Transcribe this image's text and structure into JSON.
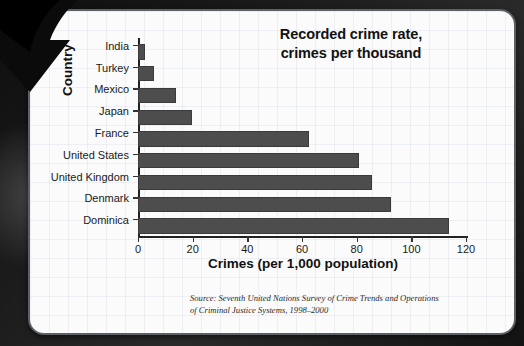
{
  "chart_data": {
    "type": "bar",
    "orientation": "horizontal",
    "title": "Recorded crime rate,\ncrimes per thousand",
    "title_line1": "Recorded crime rate,",
    "title_line2": "crimes per thousand",
    "xlabel": "Crimes (per 1,000 population)",
    "ylabel": "Country",
    "categories": [
      "India",
      "Turkey",
      "Mexico",
      "Japan",
      "France",
      "United States",
      "United Kingdom",
      "Denmark",
      "Dominica"
    ],
    "values": [
      2,
      5,
      13,
      19,
      62,
      80,
      85,
      92,
      113
    ],
    "xlim": [
      0,
      120
    ],
    "xticks": [
      0,
      20,
      40,
      60,
      80,
      100,
      120
    ],
    "xtick_labels": [
      "0",
      "20",
      "40",
      "60",
      "80",
      "100",
      "120"
    ],
    "grid": false,
    "legend": "none",
    "bar_color": "#4d4d4d",
    "axis_color": "#222222",
    "source_line1": "Source: Seventh United Nations Survey of Crime Trends and Operations",
    "source_line2": "of Criminal Justice Systems, 1998–2000"
  },
  "slide": {
    "background_color": "#1c1c1c",
    "card_background": "#fbfbfb",
    "card_border_color": "#5d6166",
    "arrow_color": "#000000",
    "arrow_icon": "down-left-arrow-icon"
  }
}
